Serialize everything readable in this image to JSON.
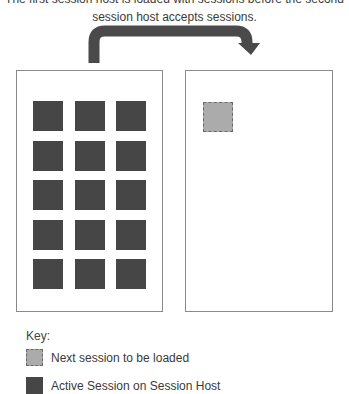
{
  "caption": {
    "line1": "The first session host is loaded with sessions before the second",
    "line2": "session host accepts sessions."
  },
  "colors": {
    "active_session": "#464646",
    "next_session": "#ababab",
    "arrow": "#4a4a4a",
    "box_border": "#8a8a8a"
  },
  "hosts": [
    {
      "name": "Session Host 1",
      "active_sessions": 15,
      "grid": {
        "columns": 3,
        "rows": 5
      }
    },
    {
      "name": "Session Host 2",
      "active_sessions": 0,
      "pending_sessions": 1
    }
  ],
  "key": {
    "title": "Key:",
    "items": [
      {
        "icon": "dashed-light-square",
        "label": "Next session to be loaded"
      },
      {
        "icon": "solid-dark-square",
        "label": "Active Session on Session Host"
      }
    ]
  }
}
